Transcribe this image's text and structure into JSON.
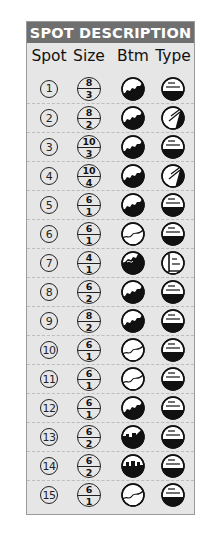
{
  "title": "SPOT DESCRIPTION",
  "columns": [
    "Spot",
    "Size",
    "Btm",
    "Type"
  ],
  "rows": [
    {
      "spot": "1",
      "size_top": "8",
      "size_bottom": "3",
      "bottom": "rock",
      "type": "flat"
    },
    {
      "spot": "2",
      "size_top": "8",
      "size_bottom": "2",
      "bottom": "rock",
      "type": "slope"
    },
    {
      "spot": "3",
      "size_top": "10",
      "size_bottom": "3",
      "bottom": "rock",
      "type": "flat"
    },
    {
      "spot": "4",
      "size_top": "10",
      "size_bottom": "4",
      "bottom": "rock",
      "type": "slope"
    },
    {
      "spot": "5",
      "size_top": "6",
      "size_bottom": "1",
      "bottom": "rock",
      "type": "flat"
    },
    {
      "spot": "6",
      "size_top": "6",
      "size_bottom": "1",
      "bottom": "sand",
      "type": "flat"
    },
    {
      "spot": "7",
      "size_top": "4",
      "size_bottom": "1",
      "bottom": "rock-high",
      "type": "wall"
    },
    {
      "spot": "8",
      "size_top": "6",
      "size_bottom": "2",
      "bottom": "rock",
      "type": "flat"
    },
    {
      "spot": "9",
      "size_top": "8",
      "size_bottom": "2",
      "bottom": "rock",
      "type": "flat"
    },
    {
      "spot": "10",
      "size_top": "6",
      "size_bottom": "1",
      "bottom": "sand",
      "type": "flat"
    },
    {
      "spot": "11",
      "size_top": "6",
      "size_bottom": "1",
      "bottom": "sand",
      "type": "flat"
    },
    {
      "spot": "12",
      "size_top": "6",
      "size_bottom": "1",
      "bottom": "rock",
      "type": "flat"
    },
    {
      "spot": "13",
      "size_top": "6",
      "size_bottom": "2",
      "bottom": "structure",
      "type": "flat"
    },
    {
      "spot": "14",
      "size_top": "6",
      "size_bottom": "2",
      "bottom": "blocks",
      "type": "flat"
    },
    {
      "spot": "15",
      "size_top": "6",
      "size_bottom": "1",
      "bottom": "sand",
      "type": "flat"
    }
  ],
  "colors": {
    "header_bg": "#6f6f6f",
    "card_bg": "#e6e6e6",
    "ink": "#111111"
  }
}
